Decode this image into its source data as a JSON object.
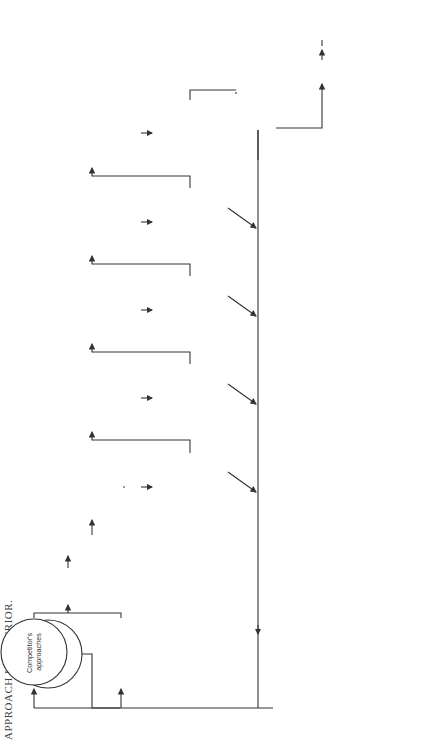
{
  "title": "APPROACH IS SUPERIOR.",
  "nodes": {
    "customer_needs": [
      "Customer",
      "Needs"
    ],
    "competitor_approaches": [
      "Competitor's",
      "approaches"
    ],
    "select_revise": [
      "Select and",
      "revise your",
      "approach"
    ],
    "stop": "STOP",
    "are_you_competitive": [
      "Are you",
      "competitive?",
      "Do you bid?"
    ],
    "evaluate_strength": [
      "Evaluate",
      "your strength",
      "vs. competitor's",
      "weaknesses"
    ],
    "features_strong": [
      "Are your",
      "features strong",
      "enough to win?"
    ],
    "evaluate_weaknesses": [
      "Evaluate your",
      "weaknesses and",
      "required",
      "corrective",
      "action"
    ],
    "neutralize": [
      "Can you",
      "neutralize",
      "weaknesses?"
    ],
    "evaluate_vulnerability": [
      "Evaluate",
      "the vulner-",
      "ability of",
      "competitor's",
      "approaches"
    ],
    "counter_strengths": [
      "Can you counter",
      "competitor's",
      "strengths?"
    ],
    "evaluate_hopes": [
      "Evaluate",
      "customer's",
      "hopes and fears"
    ],
    "exploit_hopes": [
      "Can you",
      "exploit those",
      "hopes and",
      "fears?"
    ],
    "write_thesis": [
      "Write",
      "thesis based",
      "on features,",
      "neutralizers,",
      "counters,",
      "exploiters"
    ],
    "write_scenarios": [
      "Write",
      "scenarios with",
      "argumentative",
      "headlines, lead",
      "paragraphs"
    ],
    "still_competitive": [
      "Is your",
      "approach still",
      "competitive?"
    ],
    "draft_proposal": [
      "Draft your",
      "proposal"
    ],
    "write_final": [
      "Write final",
      "proposal—",
      "check and",
      "submit"
    ]
  },
  "edge_labels": {
    "yes": "YES",
    "no": "NO"
  }
}
